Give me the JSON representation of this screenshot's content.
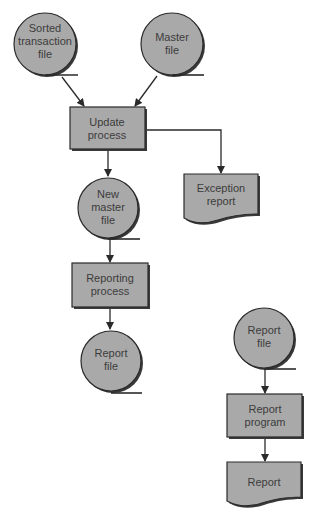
{
  "diagram": {
    "type": "system flowchart",
    "colors": {
      "shape_fill": "#a9a9a9",
      "outline": "#2a2a2a",
      "text": "#3c3c3c",
      "background": "#ffffff"
    },
    "nodes": {
      "sorted_transaction_file": {
        "shape": "magnetic-tape-file",
        "lines": [
          "Sorted",
          "transaction",
          "file"
        ]
      },
      "master_file": {
        "shape": "magnetic-tape-file",
        "lines": [
          "Master",
          "file"
        ]
      },
      "update_process": {
        "shape": "process",
        "lines": [
          "Update",
          "process"
        ]
      },
      "exception_report": {
        "shape": "document",
        "lines": [
          "Exception",
          "report"
        ]
      },
      "new_master_file": {
        "shape": "magnetic-tape-file",
        "lines": [
          "New",
          "master",
          "file"
        ]
      },
      "reporting_process": {
        "shape": "process",
        "lines": [
          "Reporting",
          "process"
        ]
      },
      "report_file_left": {
        "shape": "magnetic-tape-file",
        "lines": [
          "Report",
          "file"
        ]
      },
      "report_file_right": {
        "shape": "magnetic-tape-file",
        "lines": [
          "Report",
          "file"
        ]
      },
      "report_program": {
        "shape": "process",
        "lines": [
          "Report",
          "program"
        ]
      },
      "report": {
        "shape": "document",
        "lines": [
          "Report"
        ]
      }
    },
    "edges": [
      {
        "from": "sorted_transaction_file",
        "to": "update_process"
      },
      {
        "from": "master_file",
        "to": "update_process"
      },
      {
        "from": "update_process",
        "to": "new_master_file"
      },
      {
        "from": "update_process",
        "to": "exception_report"
      },
      {
        "from": "new_master_file",
        "to": "reporting_process"
      },
      {
        "from": "reporting_process",
        "to": "report_file_left"
      },
      {
        "from": "report_file_right",
        "to": "report_program"
      },
      {
        "from": "report_program",
        "to": "report"
      }
    ]
  }
}
